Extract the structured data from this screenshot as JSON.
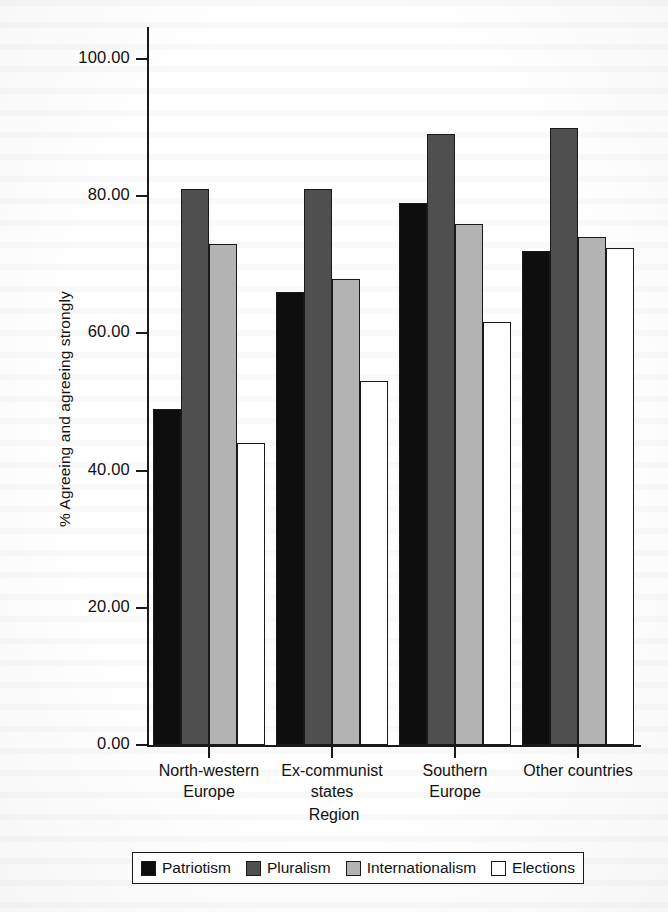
{
  "chart_data": {
    "type": "bar",
    "title": "",
    "xlabel": "Region",
    "ylabel": "% Agreeing and agreeing strongly",
    "ylim": [
      0,
      100
    ],
    "ytick_labels": [
      "0.00",
      "20.00",
      "40.00",
      "60.00",
      "80.00",
      "100.00"
    ],
    "ytick_values": [
      0,
      20,
      40,
      60,
      80,
      100
    ],
    "grid": false,
    "legend_position": "bottom",
    "categories": [
      "North-western\nEurope",
      "Ex-communist\nstates",
      "Southern\nEurope",
      "Other countries"
    ],
    "series": [
      {
        "name": "Patriotism",
        "color": "#0e0e0e",
        "values": [
          49.0,
          66.0,
          79.0,
          72.0
        ]
      },
      {
        "name": "Pluralism",
        "color": "#4f4f4f",
        "values": [
          81.0,
          81.0,
          89.0,
          90.0
        ]
      },
      {
        "name": "Internationalism",
        "color": "#b3b3b3",
        "values": [
          73.0,
          68.0,
          76.0,
          74.0
        ]
      },
      {
        "name": "Elections",
        "color": "#ffffff",
        "values": [
          44.0,
          53.0,
          61.7,
          72.5
        ]
      }
    ]
  }
}
